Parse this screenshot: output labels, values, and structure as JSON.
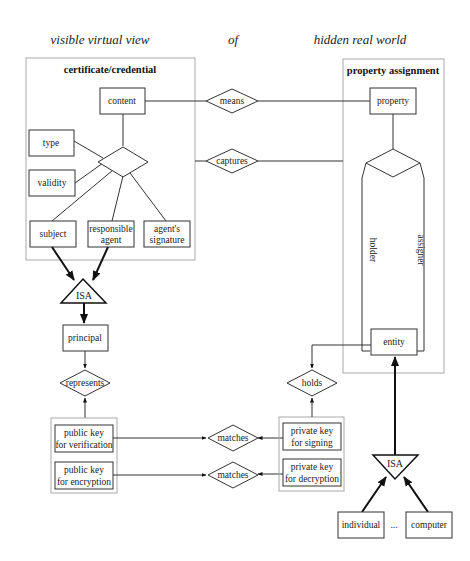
{
  "header": {
    "left": "visible virtual view",
    "middle": "of",
    "right": "hidden real world"
  },
  "certificate_group": {
    "title": "certificate/credential",
    "content": "content",
    "type": "type",
    "validity": "validity",
    "subject": "subject",
    "responsible_agent": [
      "responsible",
      "agent"
    ],
    "agents_signature": [
      "agent's",
      "signature"
    ]
  },
  "property_group": {
    "title": "property assignment",
    "property": "property",
    "holder": "holder",
    "assigner": "assigner",
    "entity": "entity"
  },
  "relations": {
    "means": "means",
    "captures": "captures",
    "represents": "represents",
    "holds": "holds",
    "matches_1": "matches",
    "matches_2": "matches"
  },
  "isa_left": {
    "label": "ISA",
    "target": "principal"
  },
  "isa_right": {
    "label": "ISA",
    "children": [
      "individual",
      "...",
      "computer"
    ]
  },
  "public_keys": [
    [
      "public key",
      "for verification"
    ],
    [
      "public key",
      "for encryption"
    ]
  ],
  "private_keys": [
    [
      "private key",
      "for signing"
    ],
    [
      "private key",
      "for decryption"
    ]
  ]
}
